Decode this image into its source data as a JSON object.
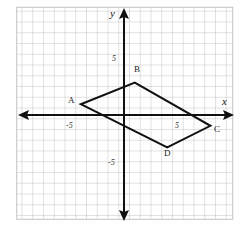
{
  "figure": {
    "kind": "coordinate-grid-parallelogram",
    "axes": {
      "x_label": "x",
      "y_label": "y",
      "x_tick_neg": "-5",
      "x_tick_pos": "5",
      "y_tick_pos": "5",
      "y_tick_neg": "-5"
    },
    "vertices": [
      {
        "name": "A",
        "x": -4,
        "y": 1
      },
      {
        "name": "B",
        "x": 1,
        "y": 3
      },
      {
        "name": "C",
        "x": 8,
        "y": -1
      },
      {
        "name": "D",
        "x": 4,
        "y": -3
      }
    ]
  },
  "chart_data": {
    "type": "scatter",
    "title": "",
    "xlabel": "x",
    "ylabel": "y",
    "xlim": [
      -10,
      10
    ],
    "ylim": [
      -10,
      10
    ],
    "grid": true,
    "legend": "none",
    "xticks": [
      -5,
      5
    ],
    "yticks": [
      -5,
      5
    ],
    "xticklabels": [
      "-5",
      "5"
    ],
    "yticklabels": [
      "-5",
      "5"
    ],
    "annotations": [
      "A",
      "B",
      "C",
      "D"
    ],
    "series": [
      {
        "name": "parallelogram ABCD",
        "closed": true,
        "x": [
          -4,
          1,
          8,
          4
        ],
        "y": [
          1,
          3,
          -1,
          -3
        ]
      }
    ]
  },
  "geometry": {
    "origin_px": {
      "x": 124,
      "y": 115
    },
    "cell_px": 10.8,
    "grid_rect_px": {
      "left": 18,
      "top": 8,
      "right": 233,
      "bottom": 219
    }
  },
  "colors": {
    "grid": "#b9b9b9",
    "axis": "#111111",
    "shape": "#111111",
    "background": "#fefefe"
  }
}
